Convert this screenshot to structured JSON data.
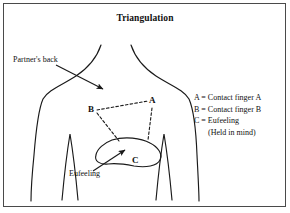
{
  "figure": {
    "title": "Triangulation",
    "kind": "anatomical-diagram"
  },
  "annotations": {
    "partners_back": "Partner's back",
    "eufeeling": "Eufeeling",
    "point_a": "A",
    "point_b": "B",
    "point_c": "C"
  },
  "legend": {
    "line_a": "A = Contact finger A",
    "line_b": "B = Contact finger B",
    "line_c": "C = Eufeeling",
    "line_c_sub": "(Held in mind)"
  },
  "colors": {
    "ink": "#111111",
    "stroke": "#1a1a1a",
    "frame": "#4a4a4a",
    "background": "#ffffff"
  }
}
